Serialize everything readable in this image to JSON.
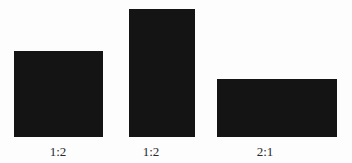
{
  "figure": {
    "background": "#fdfdfd",
    "fill_color": "#141414",
    "label_color": "#2a2a2a",
    "shapes": [
      {
        "label": "1:2",
        "x": 14,
        "y": 51,
        "width": 89,
        "height": 86
      },
      {
        "label": "1:2",
        "x": 129,
        "y": 9,
        "width": 66,
        "height": 128
      },
      {
        "label": "2:1",
        "x": 217,
        "y": 79,
        "width": 120,
        "height": 58
      }
    ]
  }
}
